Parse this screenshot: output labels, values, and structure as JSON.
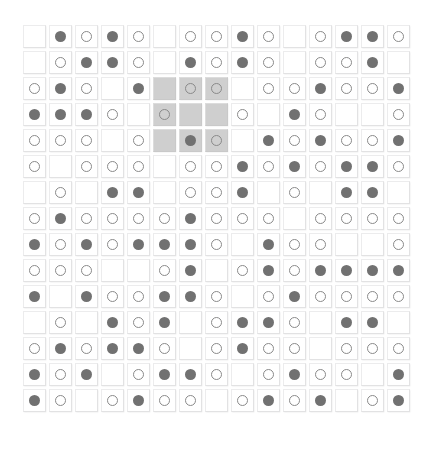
{
  "figure": {
    "name": "tile-grid-puzzle",
    "kind": "grid-of-tiles",
    "rows": 15,
    "columns": 15,
    "cell_pitch_px": 26,
    "tile_size_px": 23,
    "background_color": "#ffffff",
    "colors": {
      "tile_face": "#ffffff",
      "tile_border": "#ececed",
      "tile_shadow": "rgba(150,150,152,0.30)",
      "highlight_face": "#cfcfcf",
      "filled_dot": "#717171",
      "open_ring_stroke": "#8a8a8a"
    },
    "legend": [
      {
        "symbol": "filled",
        "label": "filled dot"
      },
      {
        "symbol": "open",
        "label": "open ring"
      },
      {
        "symbol": "empty",
        "label": "blank tile"
      }
    ],
    "highlight_region": {
      "label": "3x3 shaded block",
      "row_start": 3,
      "row_end": 5,
      "col_start": 6,
      "col_end": 8,
      "fill": "#cfcfcf"
    }
  },
  "grid": {
    "cells": [
      [
        "empty",
        "filled",
        "open",
        "filled",
        "open",
        "empty",
        "open",
        "open",
        "filled",
        "open",
        "empty",
        "open",
        "filled",
        "filled",
        "open"
      ],
      [
        "empty",
        "open",
        "filled",
        "filled",
        "open",
        "empty",
        "filled",
        "open",
        "filled",
        "open",
        "empty",
        "open",
        "open",
        "filled",
        "empty"
      ],
      [
        "open",
        "filled",
        "open",
        "empty",
        "filled",
        "empty",
        "open",
        "open",
        "empty",
        "open",
        "open",
        "filled",
        "open",
        "open",
        "filled"
      ],
      [
        "filled",
        "filled",
        "filled",
        "open",
        "empty",
        "open",
        "empty",
        "empty",
        "open",
        "empty",
        "filled",
        "open",
        "empty",
        "empty",
        "open"
      ],
      [
        "open",
        "open",
        "open",
        "empty",
        "open",
        "empty",
        "filled",
        "open",
        "empty",
        "filled",
        "open",
        "filled",
        "open",
        "open",
        "filled"
      ],
      [
        "open",
        "empty",
        "open",
        "open",
        "open",
        "empty",
        "open",
        "open",
        "filled",
        "open",
        "filled",
        "open",
        "filled",
        "filled",
        "open"
      ],
      [
        "empty",
        "open",
        "empty",
        "filled",
        "filled",
        "empty",
        "open",
        "open",
        "filled",
        "empty",
        "open",
        "empty",
        "filled",
        "filled",
        "empty"
      ],
      [
        "open",
        "filled",
        "open",
        "open",
        "open",
        "open",
        "filled",
        "open",
        "open",
        "open",
        "empty",
        "open",
        "open",
        "open",
        "open"
      ],
      [
        "filled",
        "open",
        "filled",
        "open",
        "filled",
        "filled",
        "filled",
        "open",
        "empty",
        "filled",
        "open",
        "open",
        "empty",
        "empty",
        "open"
      ],
      [
        "open",
        "open",
        "open",
        "empty",
        "empty",
        "open",
        "filled",
        "empty",
        "open",
        "filled",
        "open",
        "filled",
        "filled",
        "filled",
        "filled"
      ],
      [
        "filled",
        "empty",
        "filled",
        "open",
        "open",
        "filled",
        "filled",
        "open",
        "empty",
        "open",
        "filled",
        "open",
        "open",
        "open",
        "open"
      ],
      [
        "empty",
        "open",
        "empty",
        "filled",
        "open",
        "filled",
        "empty",
        "open",
        "filled",
        "filled",
        "open",
        "empty",
        "filled",
        "filled",
        "empty"
      ],
      [
        "open",
        "filled",
        "open",
        "filled",
        "filled",
        "open",
        "empty",
        "open",
        "filled",
        "open",
        "open",
        "empty",
        "open",
        "open",
        "open"
      ],
      [
        "filled",
        "open",
        "filled",
        "empty",
        "open",
        "filled",
        "filled",
        "open",
        "empty",
        "open",
        "filled",
        "open",
        "open",
        "empty",
        "filled"
      ],
      [
        "filled",
        "open",
        "empty",
        "open",
        "filled",
        "open",
        "open",
        "empty",
        "open",
        "filled",
        "open",
        "filled",
        "empty",
        "open",
        "filled"
      ]
    ],
    "highlighted_cells": [
      [
        3,
        6
      ],
      [
        3,
        7
      ],
      [
        3,
        8
      ],
      [
        4,
        6
      ],
      [
        4,
        7
      ],
      [
        4,
        8
      ],
      [
        5,
        6
      ],
      [
        5,
        7
      ],
      [
        5,
        8
      ]
    ]
  }
}
